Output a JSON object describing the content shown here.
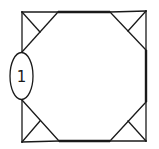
{
  "diagram": {
    "type": "geometric-figure",
    "colors": {
      "stroke": "#1a1a1a",
      "background": "#ffffff"
    },
    "square": {
      "corners": [
        [
          22,
          12
        ],
        [
          146,
          11
        ],
        [
          146,
          141
        ],
        [
          22,
          142
        ]
      ]
    },
    "octagon": {
      "vertices": [
        [
          58,
          12
        ],
        [
          110,
          12
        ],
        [
          146,
          50
        ],
        [
          146,
          102
        ],
        [
          110,
          141
        ],
        [
          59,
          141
        ],
        [
          22,
          100
        ],
        [
          22,
          52
        ]
      ],
      "thick_edges": [
        {
          "from": [
            58,
            12
          ],
          "to": [
            110,
            12
          ]
        },
        {
          "from": [
            146,
            50
          ],
          "to": [
            146,
            102
          ]
        },
        {
          "from": [
            110,
            141
          ],
          "to": [
            59,
            141
          ]
        }
      ]
    },
    "corner_bisectors": [
      {
        "from": [
          22,
          12
        ],
        "to": [
          40,
          32
        ]
      },
      {
        "from": [
          146,
          11
        ],
        "to": [
          128,
          31
        ]
      },
      {
        "from": [
          146,
          141
        ],
        "to": [
          128,
          121
        ]
      },
      {
        "from": [
          22,
          142
        ],
        "to": [
          40,
          121
        ]
      }
    ],
    "nodes": [
      {
        "id": "node-1",
        "label": "1",
        "cx": 21.5,
        "cy": 76,
        "rx": 11.5,
        "ry": 23.5
      }
    ]
  }
}
